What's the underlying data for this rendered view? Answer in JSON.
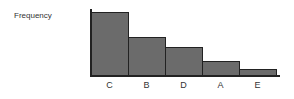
{
  "chart_data": {
    "type": "bar",
    "title": "",
    "xlabel": "",
    "ylabel": "Frequency",
    "categories": [
      "C",
      "B",
      "D",
      "A",
      "E"
    ],
    "values": [
      10,
      6.1,
      4.4,
      2.3,
      1.0
    ],
    "ylim": [
      0,
      10.5
    ],
    "grid": false,
    "legend": null,
    "note": "Pareto-style bars sorted descending, no numeric y ticks shown"
  }
}
